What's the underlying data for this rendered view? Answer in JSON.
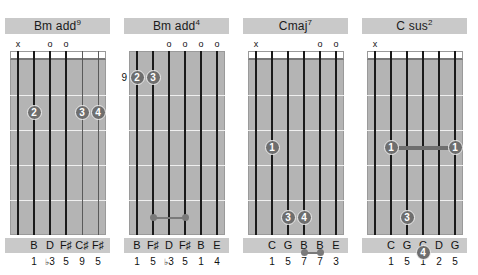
{
  "page": {
    "kind": "guitar-chord-chart",
    "background_color": "#ffffff",
    "label_bg_color": "#c9c9c9",
    "fretboard_color": "#b4b4b4",
    "dot_color": "#6e6e6e",
    "string_color": "#1a1a1a",
    "muted_symbol": "x",
    "open_symbol": "o",
    "num_strings": 6,
    "num_frets": 5
  },
  "diagrams": [
    {
      "id": "chord-1",
      "title_root": "Bm add",
      "title_sup": "9",
      "title_full": "Bm add9",
      "base_fret": "",
      "markers": [
        {
          "string": 1,
          "symbol": "x"
        },
        {
          "string": 2,
          "symbol": ""
        },
        {
          "string": 3,
          "symbol": "o"
        },
        {
          "string": 4,
          "symbol": "o"
        },
        {
          "string": 5,
          "symbol": ""
        },
        {
          "string": 6,
          "symbol": ""
        }
      ],
      "fingers": [
        {
          "string": 2,
          "fret": 2,
          "label": "2"
        },
        {
          "string": 5,
          "fret": 2,
          "label": "3"
        },
        {
          "string": 6,
          "fret": 2,
          "label": "4"
        }
      ],
      "barres": [],
      "small_dots": [],
      "small_bars": [],
      "notes": [
        "",
        "B",
        "D",
        "F♯",
        "C♯",
        "F♯"
      ],
      "intervals": [
        "",
        "1",
        "♭3",
        "5",
        "9",
        "5"
      ]
    },
    {
      "id": "chord-2",
      "title_root": "Bm add",
      "title_sup": "4",
      "title_full": "Bm add4",
      "base_fret": "9",
      "markers": [
        {
          "string": 1,
          "symbol": ""
        },
        {
          "string": 2,
          "symbol": ""
        },
        {
          "string": 3,
          "symbol": "o"
        },
        {
          "string": 4,
          "symbol": "o"
        },
        {
          "string": 5,
          "symbol": "o"
        },
        {
          "string": 6,
          "symbol": "o"
        }
      ],
      "fingers": [
        {
          "string": 1,
          "fret": 1,
          "label": "2"
        },
        {
          "string": 2,
          "fret": 1,
          "label": "3"
        }
      ],
      "barres": [],
      "small_dots": [
        {
          "string": 2,
          "fret": 5
        },
        {
          "string": 4,
          "fret": 5
        }
      ],
      "small_bars": [
        {
          "from_string": 2,
          "to_string": 4,
          "fret": 5
        }
      ],
      "notes": [
        "B",
        "F♯",
        "D",
        "F♯",
        "B",
        "E"
      ],
      "intervals": [
        "1",
        "5",
        "♭3",
        "5",
        "1",
        "4"
      ]
    },
    {
      "id": "chord-3",
      "title_root": "Cmaj",
      "title_sup": "7",
      "title_full": "Cmaj7",
      "base_fret": "",
      "markers": [
        {
          "string": 1,
          "symbol": "x"
        },
        {
          "string": 2,
          "symbol": ""
        },
        {
          "string": 3,
          "symbol": ""
        },
        {
          "string": 4,
          "symbol": ""
        },
        {
          "string": 5,
          "symbol": "o"
        },
        {
          "string": 6,
          "symbol": "o"
        }
      ],
      "fingers": [
        {
          "string": 2,
          "fret": 3,
          "label": "1"
        },
        {
          "string": 3,
          "fret": 5,
          "label": "3"
        },
        {
          "string": 4,
          "fret": 5,
          "label": "4"
        }
      ],
      "barres": [],
      "small_dots": [
        {
          "string": 4,
          "fret": 6
        },
        {
          "string": 5,
          "fret": 6
        }
      ],
      "small_bars": [
        {
          "from_string": 4,
          "to_string": 5,
          "fret": 6
        }
      ],
      "notes": [
        "",
        "C",
        "G",
        "B",
        "B",
        "E"
      ],
      "intervals": [
        "",
        "1",
        "5",
        "7",
        "7",
        "3"
      ]
    },
    {
      "id": "chord-4",
      "title_root": "C sus",
      "title_sup": "2",
      "title_full": "C sus2",
      "base_fret": "",
      "markers": [
        {
          "string": 1,
          "symbol": "x"
        },
        {
          "string": 2,
          "symbol": ""
        },
        {
          "string": 3,
          "symbol": ""
        },
        {
          "string": 4,
          "symbol": ""
        },
        {
          "string": 5,
          "symbol": ""
        },
        {
          "string": 6,
          "symbol": ""
        }
      ],
      "fingers": [
        {
          "string": 2,
          "fret": 3,
          "label": "1"
        },
        {
          "string": 6,
          "fret": 3,
          "label": "1"
        },
        {
          "string": 3,
          "fret": 5,
          "label": "3"
        },
        {
          "string": 4,
          "fret": 6,
          "label": "4"
        }
      ],
      "barres": [
        {
          "from_string": 2,
          "to_string": 6,
          "fret": 3
        }
      ],
      "small_dots": [],
      "small_bars": [],
      "notes": [
        "",
        "C",
        "G",
        "C",
        "D",
        "G"
      ],
      "intervals": [
        "",
        "1",
        "5",
        "1",
        "2",
        "5"
      ]
    }
  ]
}
